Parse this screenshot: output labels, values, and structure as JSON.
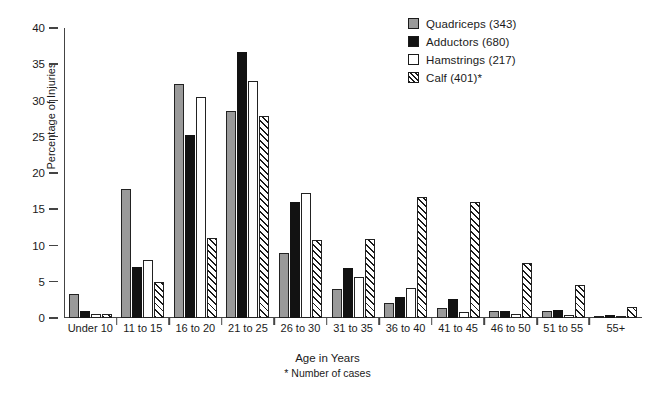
{
  "chart_data": {
    "type": "bar",
    "title": "",
    "xlabel": "Age in Years",
    "ylabel": "Percentage of Injuries",
    "ylim": [
      0,
      40
    ],
    "yticks": [
      0,
      5,
      10,
      15,
      20,
      25,
      30,
      35,
      40
    ],
    "grid": false,
    "legend_position": "top-right",
    "footnote": "* Number of cases",
    "categories": [
      "Under 10",
      "11 to 15",
      "16 to 20",
      "21 to 25",
      "26 to 30",
      "31 to 35",
      "36 to 40",
      "41 to 45",
      "46 to 50",
      "51 to 55",
      "55+"
    ],
    "series": [
      {
        "name": "Quadriceps (343)",
        "label": "Quadriceps",
        "cases": 343,
        "fill": "solid-gray",
        "color": "#9a9a9a",
        "values": [
          3.3,
          17.8,
          32.3,
          28.5,
          8.9,
          4.0,
          2.1,
          1.4,
          0.9,
          0.9,
          0.0
        ]
      },
      {
        "name": "Adductors (680)",
        "label": "Adductors",
        "cases": 680,
        "fill": "solid-black",
        "color": "#121212",
        "values": [
          1.0,
          7.0,
          25.3,
          36.7,
          16.0,
          6.9,
          2.9,
          2.6,
          1.0,
          1.1,
          0.4
        ]
      },
      {
        "name": "Hamstrings (217)",
        "label": "Hamstrings",
        "cases": 217,
        "fill": "open-white",
        "color": "#ffffff",
        "values": [
          0.5,
          8.0,
          30.5,
          32.7,
          17.2,
          5.6,
          4.1,
          0.8,
          0.5,
          0.4,
          0.0
        ]
      },
      {
        "name": "Calf (401)*",
        "label": "Calf",
        "cases": 401,
        "fill": "diagonal-hatch",
        "color": "#ffffff",
        "values": [
          0.5,
          5.0,
          11.0,
          27.8,
          10.7,
          10.9,
          16.7,
          16.0,
          7.6,
          4.5,
          1.5
        ]
      }
    ]
  }
}
